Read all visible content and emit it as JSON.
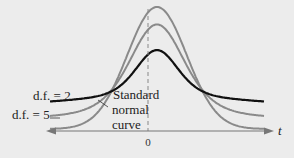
{
  "chart_data": {
    "type": "line",
    "title": "",
    "xlabel": "t",
    "ylabel": "",
    "x_ticks": [
      "0"
    ],
    "xlim": [
      -3.6,
      3.6
    ],
    "series": [
      {
        "name": "Standard normal curve",
        "df": "inf",
        "color": "#8a8a8a",
        "width": 2
      },
      {
        "name": "d.f. = 5",
        "df": 5,
        "color": "#8a8a8a",
        "width": 2
      },
      {
        "name": "d.f. = 2",
        "df": 2,
        "color": "#111111",
        "width": 2.2
      }
    ],
    "annotations": [
      {
        "text": "d.f. = 2",
        "target": "d.f. = 2"
      },
      {
        "text": "d.f. = 5",
        "target": "d.f. = 5"
      },
      {
        "text": [
          "Standard",
          "normal",
          "curve"
        ],
        "target": "Standard normal curve"
      }
    ],
    "grid": false,
    "legend": "none"
  },
  "labels": {
    "df2": "d.f. = 2",
    "df5": "d.f. = 5",
    "std1": "Standard",
    "std2": "normal",
    "std3": "curve",
    "zero": "0",
    "t": "t"
  }
}
